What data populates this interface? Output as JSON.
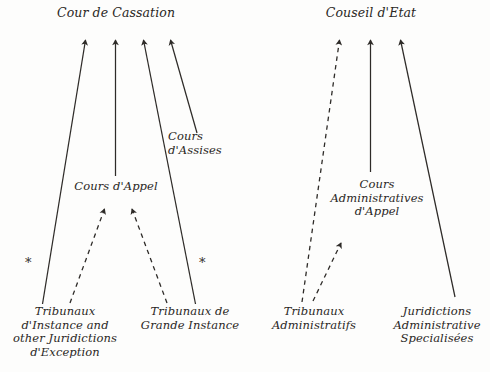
{
  "diagram": {
    "title_judicial": "Cour de Cassation",
    "title_administrative": "Couseil d'Etat",
    "nodes": {
      "cour_cassation": "Cour de Cassation",
      "couseil_etat": "Couseil d'Etat",
      "cours_assises": "Cours\nd'Assises",
      "cours_appel": "Cours d'Appel",
      "cours_admin_appel": "Cours\nAdministratives\nd'Appel",
      "tribunaux_instance": "Tribunaux\nd'Instance and\nother Juridictions\nd'Exception",
      "tribunaux_grande_instance": "Tribunaux de\nGrande Instance",
      "tribunaux_administratifs": "Tribunaux\nAdministratifs",
      "juridictions_specialisees": "Juridictions\nAdministrative\nSpecialisées"
    },
    "footnote_markers": {
      "left": "*",
      "right": "*"
    },
    "colors": {
      "ink": "#2a2724",
      "line": "#2e2b28",
      "background": "#fdfdfc"
    },
    "edges": [
      {
        "name": "tribunaux-instance-to-cour-cassation",
        "style": "solid"
      },
      {
        "name": "cours-appel-to-cour-cassation",
        "style": "solid"
      },
      {
        "name": "tribunaux-grande-instance-to-cour-cassation",
        "style": "solid"
      },
      {
        "name": "cours-assises-to-cour-cassation",
        "style": "solid"
      },
      {
        "name": "tribunaux-instance-to-cours-appel",
        "style": "dashed"
      },
      {
        "name": "tribunaux-grande-instance-to-cours-appel",
        "style": "dashed"
      },
      {
        "name": "tribunaux-administratifs-to-couseil-etat",
        "style": "dashed"
      },
      {
        "name": "cours-admin-appel-to-couseil-etat",
        "style": "solid"
      },
      {
        "name": "juridictions-specialisees-to-couseil-etat",
        "style": "solid"
      },
      {
        "name": "tribunaux-administratifs-to-cours-admin-appel",
        "style": "dashed"
      }
    ]
  }
}
